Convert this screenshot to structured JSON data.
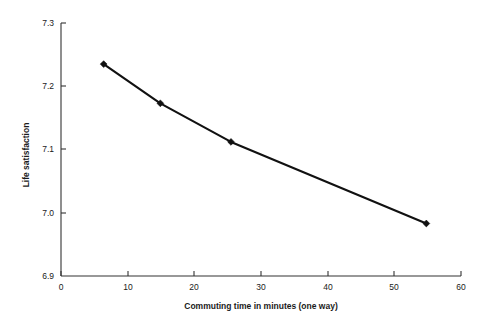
{
  "chart_data": {
    "type": "line",
    "title": "",
    "subtitle": "",
    "xlabel": "Commuting time in minutes (one way)",
    "ylabel": "Life satisfaction",
    "xlim": [
      0,
      60
    ],
    "ylim": [
      6.9,
      7.3
    ],
    "xticks": [
      0,
      10,
      20,
      30,
      40,
      50,
      60
    ],
    "xtick_labels": [
      "0",
      "10",
      "20",
      "30",
      "40",
      "50",
      "60"
    ],
    "yticks": [
      6.9,
      7.0,
      7.1,
      7.2,
      7.3
    ],
    "ytick_labels": [
      "6.9",
      "7.0",
      "7.1",
      "7.2",
      "7.3"
    ],
    "grid": false,
    "legend": false,
    "legend_position": "none",
    "marker": "diamond",
    "line_color": "#111111",
    "marker_color": "#111111",
    "axis_color": "#333333",
    "background_color": "#ffffff",
    "x": [
      6.4,
      14.9,
      25.5,
      54.8
    ],
    "series": [
      {
        "name": "Life satisfaction",
        "values": [
          7.235,
          7.173,
          7.112,
          6.983
        ]
      }
    ],
    "points": [
      {
        "x": 6.4,
        "y": 7.235
      },
      {
        "x": 14.9,
        "y": 7.173
      },
      {
        "x": 25.5,
        "y": 7.112
      },
      {
        "x": 54.8,
        "y": 6.983
      }
    ],
    "annotations": []
  }
}
